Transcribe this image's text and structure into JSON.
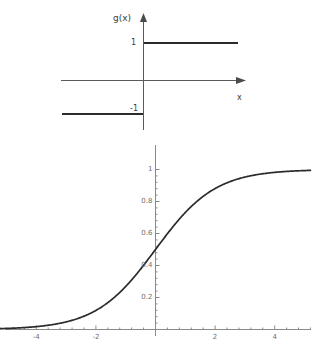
{
  "figure": {
    "width": 331,
    "height": 354,
    "background": "#ffffff",
    "ink_color": "#2b2b2b",
    "axis_color": "#5a5a5a",
    "tick_text_color": "#6e6e6e"
  },
  "panels": [
    {
      "id": "step-function",
      "axis_labels": {
        "y": "g(x)",
        "x": "x"
      },
      "value_labels": {
        "upper": "1",
        "lower": "-1"
      }
    },
    {
      "id": "sigmoid-function",
      "y_ticks": [
        "0.2",
        "0.4",
        "0.6",
        "0.8",
        "1"
      ],
      "x_ticks": [
        "-4",
        "-2",
        "2",
        "4"
      ]
    }
  ],
  "chart_data": [
    {
      "type": "line",
      "id": "step-function",
      "title": "",
      "xlabel": "x",
      "ylabel": "g(x)",
      "xlim": [
        -5.5,
        5.5
      ],
      "ylim": [
        -1.6,
        1.6
      ],
      "grid": false,
      "legend": null,
      "axes_style": "arrowed-cartesian-cross",
      "y_value_ticks": [
        -1,
        1
      ],
      "y_value_tick_labels": [
        "-1",
        "1"
      ],
      "series": [
        {
          "name": "g(x) = -1 for x < 0",
          "x": [
            -5.0,
            -0.02
          ],
          "y": [
            -1,
            -1
          ]
        },
        {
          "name": "g(x) = 1 for x > 0",
          "x": [
            0.02,
            5.8
          ],
          "y": [
            1,
            1
          ]
        }
      ],
      "annotations": [
        {
          "text": "g(x)",
          "position": "y-axis-top"
        },
        {
          "text": "x",
          "position": "x-axis-right"
        },
        {
          "text": "1",
          "position": "y-axis-left-at-1"
        },
        {
          "text": "-1",
          "position": "y-axis-left-at-minus1"
        }
      ]
    },
    {
      "type": "line",
      "id": "sigmoid-function",
      "title": "",
      "xlabel": "",
      "ylabel": "",
      "xlim": [
        -5.2,
        5.2
      ],
      "ylim": [
        0,
        1.02
      ],
      "grid": false,
      "legend": null,
      "formula": "1/(1+exp(-x))",
      "x_ticks": [
        -4,
        -2,
        2,
        4
      ],
      "x_tick_labels": [
        "-4",
        "-2",
        "2",
        "4"
      ],
      "y_ticks": [
        0.2,
        0.4,
        0.6,
        0.8,
        1
      ],
      "y_tick_labels": [
        "0.2",
        "0.4",
        "0.6",
        "0.8",
        "1"
      ],
      "x_minor_tick_step": 0.4,
      "y_minor_tick_step": 0.04,
      "series": [
        {
          "name": "sigmoid",
          "x": [
            -5.2,
            -5.0,
            -4.6,
            -4.2,
            -3.8,
            -3.4,
            -3.0,
            -2.6,
            -2.2,
            -1.8,
            -1.4,
            -1.0,
            -0.6,
            -0.2,
            0.2,
            0.6,
            1.0,
            1.4,
            1.8,
            2.2,
            2.6,
            3.0,
            3.4,
            3.8,
            4.2,
            4.6,
            5.0,
            5.2
          ],
          "y": [
            0.0055,
            0.0067,
            0.01,
            0.0148,
            0.0219,
            0.0323,
            0.0474,
            0.0691,
            0.0998,
            0.1419,
            0.1978,
            0.2689,
            0.3543,
            0.4502,
            0.5498,
            0.6457,
            0.7311,
            0.8022,
            0.8581,
            0.9002,
            0.9309,
            0.9526,
            0.9677,
            0.9781,
            0.9852,
            0.99,
            0.9933,
            0.9945
          ]
        }
      ]
    }
  ]
}
